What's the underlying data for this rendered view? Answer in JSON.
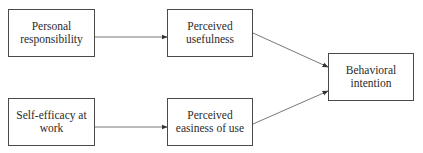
{
  "diagram": {
    "type": "flowchart",
    "nodes": [
      {
        "id": "personal_responsibility",
        "label": "Personal responsibility",
        "lines": [
          "Personal",
          "responsibility"
        ]
      },
      {
        "id": "perceived_usefulness",
        "label": "Perceived usefulness",
        "lines": [
          "Perceived",
          "usefulness"
        ]
      },
      {
        "id": "behavioral_intention",
        "label": "Behavioral intention",
        "lines": [
          "Behavioral",
          "intention"
        ]
      },
      {
        "id": "self_efficacy",
        "label": "Self-efficacy at work",
        "lines": [
          "Self-efficacy at",
          "work"
        ]
      },
      {
        "id": "perceived_easiness",
        "label": "Perceived easiness of use",
        "lines": [
          "Perceived",
          "easiness of use"
        ]
      }
    ],
    "edges": [
      {
        "from": "personal_responsibility",
        "to": "perceived_usefulness"
      },
      {
        "from": "self_efficacy",
        "to": "perceived_easiness"
      },
      {
        "from": "perceived_usefulness",
        "to": "behavioral_intention"
      },
      {
        "from": "perceived_easiness",
        "to": "behavioral_intention"
      }
    ],
    "colors": {
      "stroke": "#4a4a4a",
      "text": "#2b2b2b",
      "background": "#ffffff"
    }
  }
}
